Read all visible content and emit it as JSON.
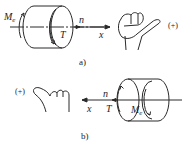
{
  "diagram": {
    "panels": [
      {
        "id": "a",
        "caption": "a)",
        "moment_label": "M",
        "moment_sub": "e",
        "speed_label": "n",
        "torque_label": "T",
        "axis_label": "x",
        "sign": "(+)",
        "axis_direction": "right"
      },
      {
        "id": "b",
        "caption": "b)",
        "moment_label": "M",
        "moment_sub": "e",
        "speed_label": "n",
        "torque_label": "T",
        "axis_label": "x",
        "sign": "(+)",
        "axis_direction": "left"
      }
    ],
    "stroke_color": "#2a2a2a",
    "background": "#ffffff"
  }
}
